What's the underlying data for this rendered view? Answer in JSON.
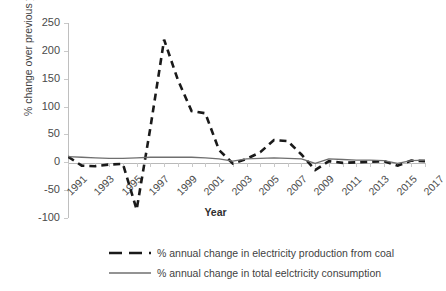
{
  "chart_data": {
    "type": "line",
    "title": "",
    "xlabel": "Year",
    "ylabel": "% change over previous year",
    "ylim": [
      -100,
      250
    ],
    "yticks": [
      250,
      200,
      150,
      100,
      50,
      0,
      -50,
      -100
    ],
    "grid": false,
    "legend_position": "bottom",
    "x": [
      1991,
      1992,
      1993,
      1994,
      1995,
      1996,
      1997,
      1998,
      1999,
      2000,
      2001,
      2002,
      2003,
      2004,
      2005,
      2006,
      2007,
      2008,
      2009,
      2010,
      2011,
      2012,
      2013,
      2014,
      2015,
      2016,
      2017
    ],
    "xtick_labels": [
      "1991",
      "1993",
      "1995",
      "1997",
      "1999",
      "2001",
      "2003",
      "2005",
      "2007",
      "2009",
      "2011",
      "2013",
      "2015",
      "2017"
    ],
    "series": [
      {
        "name": "% annual change in electricity production from coal",
        "style": "dashed",
        "color": "#1a1a1a",
        "values": [
          10,
          -6,
          -7,
          -4,
          -3,
          -85,
          62,
          220,
          148,
          92,
          88,
          22,
          -2,
          6,
          18,
          40,
          38,
          14,
          -14,
          2,
          -1,
          0,
          1,
          2,
          -6,
          3,
          2
        ]
      },
      {
        "name": "% annual change in total eelctricity consumption",
        "style": "solid",
        "color": "#6f6f6f",
        "values": [
          10,
          9,
          8,
          7,
          7,
          8,
          9,
          9,
          9,
          9,
          8,
          6,
          2,
          6,
          7,
          8,
          7,
          6,
          -2,
          6,
          5,
          4,
          4,
          3,
          -2,
          3,
          4
        ]
      }
    ]
  },
  "legend": {
    "items": [
      {
        "label": "% annual change in electricity production from coal",
        "swatch": "dashed-line-swatch"
      },
      {
        "label": "% annual change in total eelctricity consumption",
        "swatch": "solid-line-swatch"
      }
    ]
  },
  "axes": {
    "y_title": "% change over previous year",
    "x_title": "Year"
  }
}
